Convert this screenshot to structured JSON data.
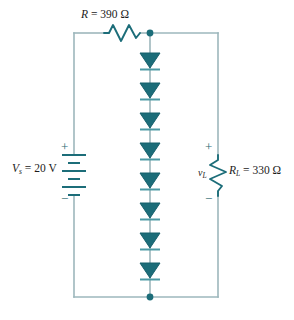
{
  "figure": {
    "kind": "circuit-schematic",
    "colors": {
      "wire": "#9db7bc",
      "component": "#1c6d79",
      "component_dark": "#17606c",
      "text": "#1b1b1b",
      "sign": "#2b6b72",
      "background": "#ffffff"
    }
  },
  "labels": {
    "series_resistor": {
      "symbol": "R",
      "equals": " = ",
      "value": "390",
      "unit": "Ω",
      "full": "R = 390 Ω"
    },
    "source": {
      "symbol": "V",
      "subscript": "s",
      "equals": " = ",
      "value": "20",
      "unit": "V",
      "full": "V  = 20 V",
      "plus": "+",
      "minus": "−"
    },
    "load_resistor": {
      "symbol": "R",
      "subscript": "L",
      "equals": " = ",
      "value": "330",
      "unit": "Ω",
      "full": "R  = 330 Ω"
    },
    "load_voltage": {
      "symbol": "v",
      "subscript": "L",
      "full": "v",
      "plus": "+",
      "minus": "−"
    }
  },
  "components": {
    "diode_string": {
      "name": "series-diode-string",
      "count": 8,
      "orientation": "cathode-down",
      "positions_y": [
        62,
        92,
        122,
        152,
        182,
        212,
        242,
        272
      ]
    },
    "battery": {
      "name": "dc-voltage-source",
      "cells": 3,
      "polarity_top": "+",
      "polarity_bottom": "−"
    },
    "series_resistor": {
      "name": "series-resistor",
      "orientation": "horizontal",
      "peaks": 3
    },
    "load_resistor": {
      "name": "load-resistor",
      "orientation": "vertical",
      "peaks": 3
    },
    "nodes": [
      {
        "name": "top-node",
        "x": 150,
        "y": 33
      },
      {
        "name": "bottom-node",
        "x": 150,
        "y": 297
      }
    ]
  },
  "geometry": {
    "left_rail_x": 74,
    "middle_branch_x": 150,
    "right_rail_x": 218,
    "top_rail_y": 33,
    "bottom_rail_y": 297
  }
}
